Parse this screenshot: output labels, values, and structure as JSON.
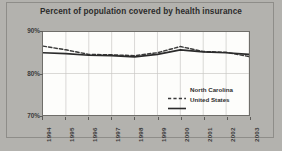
{
  "figure": {
    "background_color": "#b3b2ae",
    "plot_background_color": "#fdfdfb"
  },
  "chart_data": {
    "type": "line",
    "title": "Percent of population covered by health insurance",
    "xlabel": "",
    "ylabel": "",
    "ylim": [
      70,
      90
    ],
    "yticks": [
      70,
      80,
      90
    ],
    "ytick_labels": [
      "70%",
      "80%",
      "90%"
    ],
    "grid": true,
    "legend_position": "inside-lower-right",
    "categories": [
      "1994",
      "1995",
      "1996",
      "1997",
      "1998",
      "1999",
      "2000",
      "2001",
      "2002",
      "2003"
    ],
    "series": [
      {
        "name": "North Carolina",
        "style": "dashed",
        "color": "#3a3a3a",
        "values": [
          86.6,
          85.7,
          84.6,
          84.5,
          84.3,
          85.0,
          86.5,
          85.3,
          85.1,
          84.1
        ]
      },
      {
        "name": "United States",
        "style": "solid",
        "color": "#2b2b2b",
        "values": [
          85.0,
          84.8,
          84.4,
          84.3,
          84.0,
          84.6,
          85.7,
          85.2,
          85.0,
          84.6
        ]
      }
    ]
  },
  "legend": {
    "items": [
      {
        "label": "North Carolina",
        "style": "dashed"
      },
      {
        "label": "United States",
        "style": "solid"
      }
    ]
  }
}
